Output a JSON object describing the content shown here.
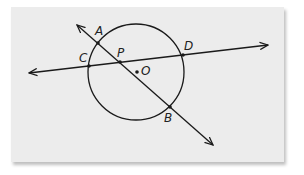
{
  "diagram": {
    "type": "circle with intersecting secant lines",
    "labels": {
      "A": "A",
      "B": "B",
      "C": "C",
      "D": "D",
      "P": "P",
      "O": "O"
    },
    "circle": {
      "center_label": "O",
      "cx": 136,
      "cy": 72,
      "r": 48
    },
    "lines": [
      {
        "name": "line AB",
        "through": [
          "A",
          "P",
          "B"
        ],
        "arrows": "both"
      },
      {
        "name": "line CD",
        "through": [
          "C",
          "P",
          "D"
        ],
        "arrows": "both"
      }
    ],
    "points": {
      "A": [
        98,
        43
      ],
      "B": [
        170,
        107
      ],
      "C": [
        89,
        66
      ],
      "D": [
        183,
        55
      ],
      "P": [
        120,
        62
      ],
      "O": [
        137,
        72
      ]
    },
    "colors": {
      "background": "#ececec",
      "stroke": "#1a1a1a"
    }
  }
}
